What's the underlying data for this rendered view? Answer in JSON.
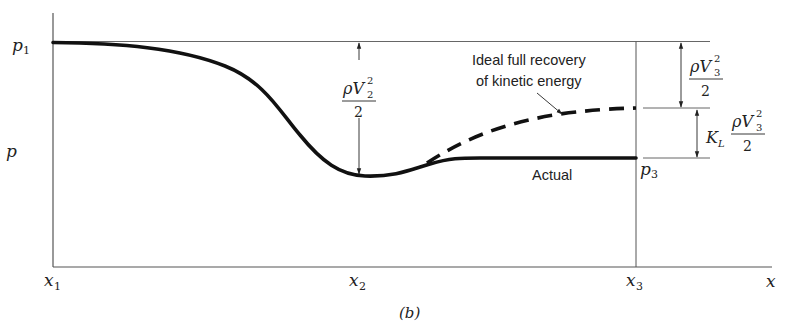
{
  "figure": {
    "caption": "(b)",
    "colors": {
      "axis": "#555555",
      "curve": "#111111",
      "text": "#222222",
      "background": "#ffffff"
    }
  },
  "axes": {
    "y_label": "p",
    "x_label": "x",
    "x_ticks": [
      {
        "base": "x",
        "sub": "1"
      },
      {
        "base": "x",
        "sub": "2"
      },
      {
        "base": "x",
        "sub": "3"
      }
    ],
    "y_ticks": [
      {
        "base": "p",
        "sub": "1"
      },
      {
        "base": "p",
        "sub": "3"
      }
    ]
  },
  "annotations": {
    "ideal_line1": "Ideal full recovery",
    "ideal_line2": "of kinetic energy",
    "actual": "Actual",
    "dynamic_pressure_2": {
      "num_base": "ρV",
      "sup": "2",
      "sub": "2",
      "den": "2"
    },
    "dynamic_pressure_3": {
      "num_base": "ρV",
      "sup": "2",
      "sub": "3",
      "den": "2"
    },
    "loss_term": {
      "coef_base": "K",
      "coef_sub": "L",
      "num_base": "ρV",
      "sup": "2",
      "sub": "3",
      "den": "2"
    }
  },
  "curves": {
    "actual": "solid",
    "ideal": "dashed"
  }
}
